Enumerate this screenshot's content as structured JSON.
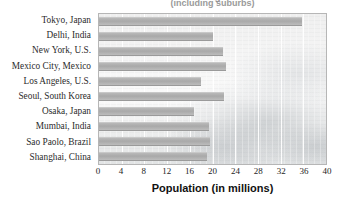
{
  "chart_data": {
    "type": "bar",
    "orientation": "horizontal",
    "title": "World's Largest Cities",
    "subtitle": "(including suburbs)",
    "xlabel": "Population (in millions)",
    "ylabel": "",
    "xlim": [
      0,
      40
    ],
    "xticks": [
      0,
      4,
      8,
      12,
      16,
      20,
      24,
      28,
      32,
      36,
      40
    ],
    "grid": "vertical",
    "legend": "none",
    "categories": [
      "Tokyo, Japan",
      "Delhi, India",
      "New York, U.S.",
      "Mexico City, Mexico",
      "Los Angeles, U.S.",
      "Seoul, South Korea",
      "Osaka, Japan",
      "Mumbai, India",
      "Sao Paolo, Brazil",
      "Shanghai, China"
    ],
    "values": [
      35.7,
      20.0,
      21.9,
      22.4,
      18.0,
      22.0,
      16.8,
      19.3,
      19.6,
      19.0
    ],
    "bar_color": "#ababab",
    "axis_color": "#b6b6b6",
    "gridline_color": "#ffffff",
    "background": "faded-city-skyline-photo"
  }
}
